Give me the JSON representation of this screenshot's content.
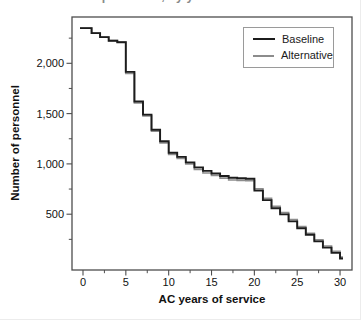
{
  "clipped_title_fragment": "AC personnel, by years of service",
  "colors": {
    "baseline": "#1c1c1c",
    "alternative": "#8c8c8c",
    "frame": "#4d4d4d",
    "tick_text": "#111111",
    "background": "#ffffff"
  },
  "legend": {
    "items": [
      {
        "label": "Baseline",
        "color": "#1c1c1c"
      },
      {
        "label": "Alternative",
        "color": "#8c8c8c"
      }
    ]
  },
  "axes": {
    "x_title": "AC years of service",
    "y_title": "Number of personnel"
  },
  "chart_data": {
    "type": "line",
    "subtype": "step-post",
    "title": "",
    "xlabel": "AC years of service",
    "ylabel": "Number of personnel",
    "xlim": [
      -1.3,
      31.5
    ],
    "ylim": [
      -55,
      2460
    ],
    "grid": false,
    "legend_position": "upper right",
    "x_major_ticks": [
      0,
      5,
      10,
      15,
      20,
      25,
      30
    ],
    "x_tick_labels": [
      "0",
      "5",
      "10",
      "15",
      "20",
      "25",
      "30"
    ],
    "x_minor_ticks": [
      2.5,
      7.5,
      12.5,
      17.5,
      22.5,
      27.5
    ],
    "y_major_ticks": [
      500,
      1000,
      1500,
      2000
    ],
    "y_tick_labels": [
      "500",
      "1,000",
      "1,500",
      "2,000"
    ],
    "y_minor_ticks": [
      250,
      750,
      1250,
      1750,
      2250
    ],
    "x": [
      0,
      1,
      2,
      3,
      4,
      5,
      6,
      7,
      8,
      9,
      10,
      11,
      12,
      13,
      14,
      15,
      16,
      17,
      18,
      19,
      20,
      21,
      22,
      23,
      24,
      25,
      26,
      27,
      28,
      29,
      30
    ],
    "series": [
      {
        "name": "Baseline",
        "color": "#1c1c1c",
        "values": [
          2350,
          2300,
          2260,
          2225,
          2210,
          1915,
          1620,
          1490,
          1340,
          1225,
          1110,
          1070,
          1015,
          965,
          930,
          905,
          880,
          862,
          857,
          853,
          735,
          640,
          560,
          498,
          428,
          360,
          295,
          230,
          168,
          115,
          60
        ]
      },
      {
        "name": "Alternative",
        "color": "#8c8c8c",
        "values": [
          2350,
          2300,
          2260,
          2225,
          2210,
          1900,
          1605,
          1478,
          1325,
          1210,
          1095,
          1055,
          1000,
          945,
          910,
          885,
          858,
          840,
          836,
          833,
          752,
          658,
          578,
          515,
          445,
          376,
          310,
          246,
          184,
          130,
          74
        ]
      }
    ]
  }
}
